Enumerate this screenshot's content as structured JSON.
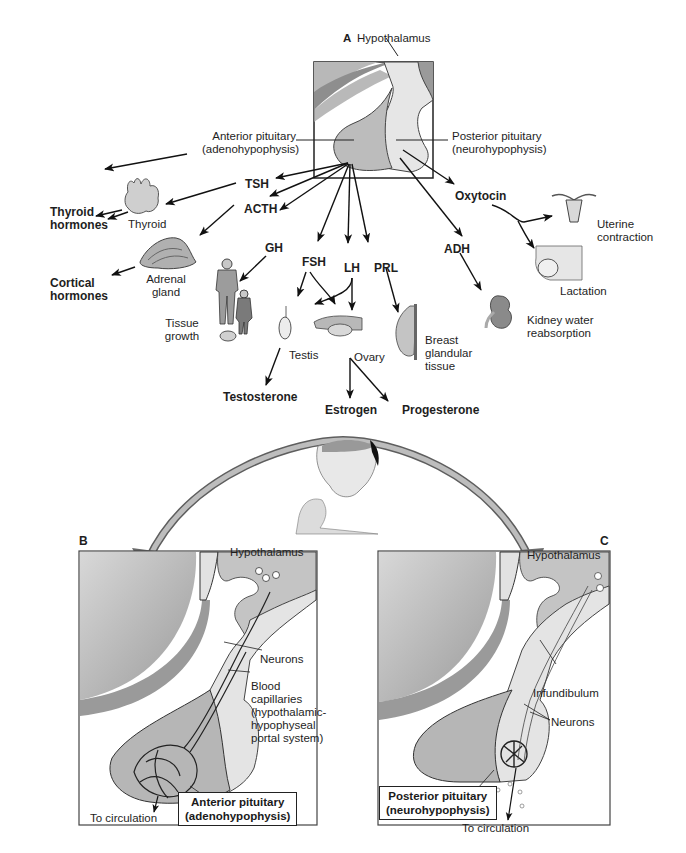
{
  "panel_a": {
    "panel_letter": "A",
    "title": "Hypothalamus",
    "anterior_label": [
      "Anterior pituitary",
      "(adenohypophysis)"
    ],
    "posterior_label": [
      "Posterior pituitary",
      "(neurohypophysis)"
    ],
    "hormones": {
      "tsh": "TSH",
      "acth": "ACTH",
      "gh": "GH",
      "fsh": "FSH",
      "lh": "LH",
      "prl": "PRL",
      "adh": "ADH",
      "oxytocin": "Oxytocin"
    },
    "targets": {
      "thyroid": "Thyroid",
      "adrenal": [
        "Adrenal",
        "gland"
      ],
      "tissue_growth": [
        "Tissue",
        "growth"
      ],
      "testis": "Testis",
      "ovary": "Ovary",
      "breast": [
        "Breast",
        "glandular",
        "tissue"
      ],
      "kidney": [
        "Kidney water",
        "reabsorption"
      ],
      "uterine": [
        "Uterine",
        "contraction"
      ],
      "lactation": "Lactation"
    },
    "products": {
      "thyroid_hormones": [
        "Thyroid",
        "hormones"
      ],
      "cortical_hormones": [
        "Cortical",
        "hormones"
      ],
      "testosterone": "Testosterone",
      "estrogen": "Estrogen",
      "progesterone": "Progesterone"
    }
  },
  "panel_b": {
    "panel_letter": "B",
    "hypothalamus": "Hypothalamus",
    "neurons": "Neurons",
    "capillaries": [
      "Blood",
      "capillaries",
      "(hypothalamic-",
      "hypophyseal",
      "portal system)"
    ],
    "pituitary_box": [
      "Anterior pituitary",
      "(adenohypophysis)"
    ],
    "circulation": "To circulation"
  },
  "panel_c": {
    "panel_letter": "C",
    "hypothalamus": "Hypothalamus",
    "infundibulum": "Infundibulum",
    "neurons": "Neurons",
    "pituitary_box": [
      "Posterior pituitary",
      "(neurohypophysis)"
    ],
    "circulation": "To circulation"
  },
  "colors": {
    "arrow": "#111111",
    "tissue_dark": "#8c8c8c",
    "tissue_mid": "#bdbdbd",
    "tissue_light": "#e4e4e4",
    "curved_arrow": "#8a8a8a"
  }
}
